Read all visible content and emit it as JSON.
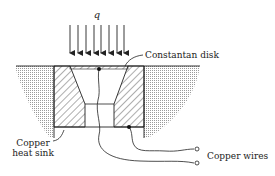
{
  "diagram": {
    "heat_flux_label": "q",
    "labels": {
      "constantan_disk": "Constantan disk",
      "copper_heat_sink_line1": "Copper",
      "copper_heat_sink_line2": "heat sink",
      "copper_wires": "Copper wires"
    },
    "arrow_count": 8,
    "colors": {
      "line": "#222222",
      "stipple": "#9a9a9a",
      "hatch": "#333333",
      "background": "#ffffff"
    }
  }
}
